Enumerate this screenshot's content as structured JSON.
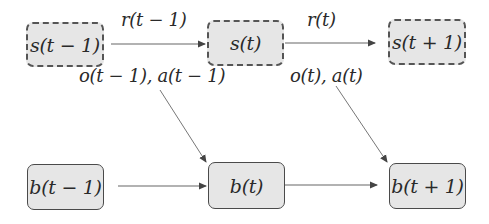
{
  "diagram": {
    "type": "belief-state transition diagram",
    "nodes": {
      "s_prev": {
        "label": "s(t − 1)",
        "kind": "state",
        "style": "dashed"
      },
      "s_curr": {
        "label": "s(t)",
        "kind": "state",
        "style": "dashed"
      },
      "s_next": {
        "label": "s(t + 1)",
        "kind": "state",
        "style": "dashed"
      },
      "b_prev": {
        "label": "b(t − 1)",
        "kind": "belief",
        "style": "solid"
      },
      "b_curr": {
        "label": "b(t)",
        "kind": "belief",
        "style": "solid"
      },
      "b_next": {
        "label": "b(t + 1)",
        "kind": "belief",
        "style": "solid"
      }
    },
    "edge_labels": {
      "reward_prev": "r(t − 1)",
      "reward_curr": "r(t)",
      "obs_action_prev": "o(t − 1), a(t − 1)",
      "obs_action_curr": "o(t), a(t)"
    },
    "edges": [
      {
        "from": "s_prev",
        "to": "s_curr",
        "label": "r(t − 1)"
      },
      {
        "from": "s_curr",
        "to": "s_next",
        "label": "r(t)"
      },
      {
        "from": "b_prev",
        "to": "b_curr",
        "label": ""
      },
      {
        "from": "b_curr",
        "to": "b_next",
        "label": ""
      },
      {
        "from": "obs_action_prev",
        "to": "b_curr",
        "label": ""
      },
      {
        "from": "obs_action_curr",
        "to": "b_next",
        "label": ""
      }
    ],
    "colors": {
      "node_fill": "#e6e6e6",
      "node_border": "#555555",
      "arrow": "#555555",
      "text": "#2a2a2a"
    }
  }
}
